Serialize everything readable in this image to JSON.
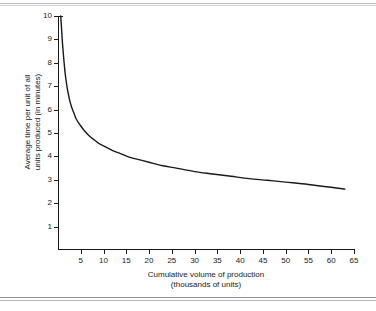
{
  "figure": {
    "background": "#ffffff",
    "line_color": "#1a1a1a",
    "rule_color": "#b9b9b9"
  },
  "chart_data": {
    "type": "line",
    "title": "",
    "xlabel": "Cumulative volume of production\n(thousands of units)",
    "xlabel_line1": "Cumulative volume of production",
    "xlabel_line2": "(thousands of units)",
    "ylabel": "Average time per unit of all\nunits produced (in minutes)",
    "ylabel_line1": "Average time per unit of all",
    "ylabel_line2": "units produced (in minutes)",
    "xlim": [
      0,
      65
    ],
    "ylim": [
      0,
      10
    ],
    "xticks": [
      5,
      10,
      15,
      20,
      25,
      30,
      35,
      40,
      45,
      50,
      55,
      60,
      65
    ],
    "yticks": [
      1,
      2,
      3,
      4,
      5,
      6,
      7,
      8,
      9,
      10
    ],
    "xtick_labels": [
      "5",
      "10",
      "15",
      "20",
      "25",
      "30",
      "35",
      "40",
      "45",
      "50",
      "55",
      "60",
      "65"
    ],
    "ytick_labels": [
      "1",
      "2",
      "3",
      "4",
      "5",
      "6",
      "7",
      "8",
      "9",
      "10"
    ],
    "grid": false,
    "legend": null,
    "series": [
      {
        "name": "Average time per unit",
        "x": [
          0.6,
          0.8,
          1.0,
          1.3,
          1.6,
          2.0,
          2.5,
          3.0,
          3.5,
          4.0,
          5.0,
          6.0,
          7.0,
          8.0,
          9.0,
          10.0,
          12.0,
          14.0,
          16.0,
          18.0,
          20.0,
          23.0,
          26.0,
          30.0,
          34.0,
          38.0,
          42.0,
          46.0,
          50.0,
          55.0,
          60.0,
          63.0
        ],
        "y": [
          10.0,
          9.4,
          8.8,
          8.1,
          7.5,
          6.95,
          6.45,
          6.1,
          5.85,
          5.6,
          5.3,
          5.05,
          4.85,
          4.7,
          4.55,
          4.45,
          4.25,
          4.1,
          3.95,
          3.85,
          3.75,
          3.6,
          3.5,
          3.35,
          3.25,
          3.15,
          3.05,
          2.98,
          2.9,
          2.8,
          2.68,
          2.6
        ]
      }
    ],
    "annotations": []
  }
}
